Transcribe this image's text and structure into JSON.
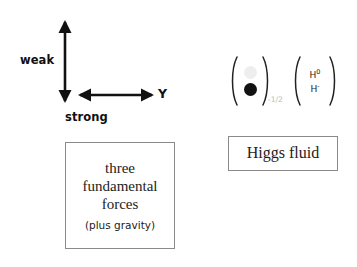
{
  "canvas": {
    "width": 357,
    "height": 267,
    "background": "#ffffff"
  },
  "axis_diagram": {
    "vertical_axis_label": "weak",
    "horizontal_axis_label": "strong",
    "horizontal_axis_name": "Y",
    "arrow_color": "#111111",
    "arrow_style": "double-headed"
  },
  "doublets": [
    {
      "name": "circle-doublet",
      "top_component": "open-circle",
      "bottom_component": "filled-circle",
      "open_circle_color": "#eeeeee",
      "filled_circle_color": "#111111",
      "subscript": "-1/2",
      "subscript_color": "#bbbbbb"
    },
    {
      "name": "higgs-field-doublet",
      "top_label": "H",
      "top_superscript": "0",
      "bottom_label": "H",
      "bottom_superscript": "-"
    }
  ],
  "boxes": {
    "forces": {
      "lines": [
        "three",
        "fundamental",
        "forces"
      ],
      "note": "(plus gravity)",
      "border_color": "#8a8a8a"
    },
    "higgs": {
      "label": "Higgs fluid",
      "border_color": "#8a8a8a"
    }
  }
}
